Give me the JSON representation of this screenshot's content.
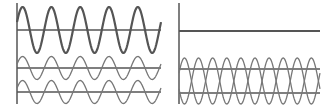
{
  "diagram": {
    "title": "",
    "colors": {
      "resultant_wave": "#555555",
      "component_wave": "#777777",
      "axis": "#555555",
      "background": "#ffffff"
    },
    "panels": [
      {
        "name": "constructive-interference",
        "cycles": 5,
        "resultant": {
          "amplitude": 2,
          "phase": 0
        },
        "components": [
          {
            "amplitude": 1,
            "phase": 0
          },
          {
            "amplitude": 1,
            "phase": 0
          }
        ]
      },
      {
        "name": "destructive-interference",
        "cycles": 5,
        "resultant": {
          "amplitude": 0,
          "phase": 0
        },
        "components": [
          {
            "amplitude": 1,
            "phase": 0
          },
          {
            "amplitude": 1,
            "phase": 180
          }
        ]
      }
    ]
  }
}
